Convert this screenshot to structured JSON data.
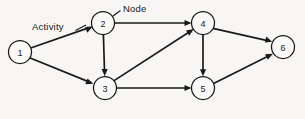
{
  "diagram": {
    "background_color": "#f7f6f4",
    "line_color": "#1a1a1a",
    "node_fill": "#faf9f7",
    "node_radius": 11.5,
    "nodes": [
      {
        "id": "1",
        "label": "1",
        "cx": 20,
        "cy": 52
      },
      {
        "id": "2",
        "label": "2",
        "cx": 103,
        "cy": 23
      },
      {
        "id": "3",
        "label": "3",
        "cx": 105,
        "cy": 88
      },
      {
        "id": "4",
        "label": "4",
        "cx": 203,
        "cy": 23
      },
      {
        "id": "5",
        "label": "5",
        "cx": 203,
        "cy": 88
      },
      {
        "id": "6",
        "label": "6",
        "cx": 283,
        "cy": 47
      }
    ],
    "edges": [
      {
        "from": "1",
        "to": "2"
      },
      {
        "from": "1",
        "to": "3"
      },
      {
        "from": "2",
        "to": "3"
      },
      {
        "from": "2",
        "to": "4"
      },
      {
        "from": "3",
        "to": "4"
      },
      {
        "from": "3",
        "to": "5"
      },
      {
        "from": "4",
        "to": "5"
      },
      {
        "from": "4",
        "to": "6"
      },
      {
        "from": "5",
        "to": "6"
      }
    ],
    "annotations": {
      "activity": "Activity",
      "node": "Node"
    }
  }
}
